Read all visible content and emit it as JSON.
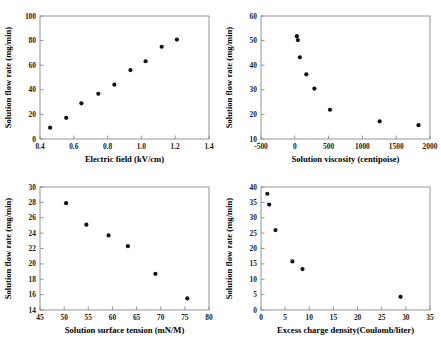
{
  "figure": {
    "title": "",
    "panel_count": 4,
    "marker_color": "#101010",
    "axis_color": "#8a8a8a"
  },
  "chart_data": [
    {
      "type": "scatter",
      "title": "",
      "xlabel": "Electric field (kV/cm)",
      "ylabel": "Solution flow rate (mg/min)",
      "xlim": [
        0.4,
        1.4
      ],
      "ylim": [
        0,
        100
      ],
      "xticks": [
        0.4,
        0.6,
        0.8,
        1.0,
        1.2,
        1.4
      ],
      "xticklabels": [
        "0.4",
        "0.6",
        "0.8",
        "1.0",
        "1.2",
        "1.4"
      ],
      "yticks": [
        0,
        20,
        40,
        60,
        80,
        100
      ],
      "yticklabels": [
        "0",
        "20",
        "40",
        "60",
        "80",
        "100"
      ],
      "grid": false,
      "legend": "none",
      "x": [
        0.46,
        0.555,
        0.645,
        0.745,
        0.84,
        0.935,
        1.025,
        1.12,
        1.21
      ],
      "y": [
        9.2,
        17.2,
        29.0,
        36.8,
        44.2,
        56.0,
        63.2,
        75.0,
        80.8
      ]
    },
    {
      "type": "scatter",
      "title": "",
      "xlabel": "Solution viscosity (centipoise)",
      "ylabel": "Solution flow rate (mg/min)",
      "xlim": [
        -500,
        2000
      ],
      "ylim": [
        10,
        60
      ],
      "xticks": [
        -500,
        0,
        500,
        1000,
        1500,
        2000
      ],
      "xticklabels": [
        "-500",
        "0",
        "500",
        "1000",
        "1500",
        "2000"
      ],
      "yticks": [
        10,
        20,
        30,
        40,
        50,
        60
      ],
      "yticklabels": [
        "10",
        "20",
        "30",
        "40",
        "50",
        "60"
      ],
      "grid": false,
      "legend": "none",
      "x": [
        30,
        45,
        75,
        170,
        290,
        520,
        1255,
        1830
      ],
      "y": [
        51.8,
        50.2,
        43.2,
        36.3,
        30.5,
        21.9,
        17.2,
        15.6
      ]
    },
    {
      "type": "scatter",
      "title": "",
      "xlabel": "Solution surface tension (mN/M)",
      "ylabel": "Solution flow rate (mg/min)",
      "xlim": [
        45,
        80
      ],
      "ylim": [
        14,
        30
      ],
      "xticks": [
        45,
        50,
        55,
        60,
        65,
        70,
        75,
        80
      ],
      "xticklabels": [
        "45",
        "50",
        "55",
        "60",
        "65",
        "70",
        "75",
        "80"
      ],
      "yticks": [
        14,
        16,
        18,
        20,
        22,
        24,
        26,
        28,
        30
      ],
      "yticklabels": [
        "14",
        "16",
        "18",
        "20",
        "22",
        "24",
        "26",
        "28",
        "30"
      ],
      "grid": false,
      "legend": "none",
      "x": [
        50.4,
        54.6,
        59.2,
        63.2,
        68.9,
        75.5
      ],
      "y": [
        27.9,
        25.1,
        23.7,
        22.3,
        18.7,
        15.5
      ]
    },
    {
      "type": "scatter",
      "title": "",
      "xlabel": "Excess charge density(Coulomb/liter)",
      "ylabel": "Solution flow rate (mg/min)",
      "xlim": [
        0,
        35
      ],
      "ylim": [
        0,
        40
      ],
      "xticks": [
        0,
        5,
        10,
        15,
        20,
        25,
        30,
        35
      ],
      "xticklabels": [
        "0",
        "5",
        "10",
        "15",
        "20",
        "25",
        "30",
        "35"
      ],
      "yticks": [
        0,
        5,
        10,
        15,
        20,
        25,
        30,
        35,
        40
      ],
      "yticklabels": [
        "0",
        "5",
        "10",
        "15",
        "20",
        "25",
        "30",
        "35",
        "40"
      ],
      "grid": false,
      "legend": "none",
      "x": [
        1.3,
        1.7,
        3.0,
        6.5,
        8.6,
        28.9
      ],
      "y": [
        37.8,
        34.3,
        26.0,
        15.8,
        13.3,
        4.3
      ]
    }
  ]
}
